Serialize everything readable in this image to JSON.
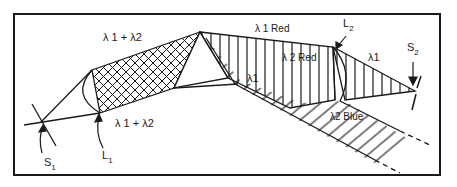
{
  "diagram": {
    "type": "optical beam path schematic",
    "labels": {
      "l12_top": "λ 1 + λ2",
      "l12_bottom": "λ 1 + λ2",
      "l1_red": "λ 1  Red",
      "l2_red": "λ 2  Red",
      "l1_inner": "λ1",
      "l1_right": "λ1",
      "l2_blue": "λ2  Blue",
      "s1_main": "S",
      "s1_sub": "1",
      "s2_main": "S",
      "s2_sub": "2",
      "lens1_main": "L",
      "lens1_sub": "1",
      "lens2_main": "L",
      "lens2_sub": "2"
    },
    "colors": {
      "ink": "#1a1a1a",
      "background": "#ffffff"
    }
  }
}
